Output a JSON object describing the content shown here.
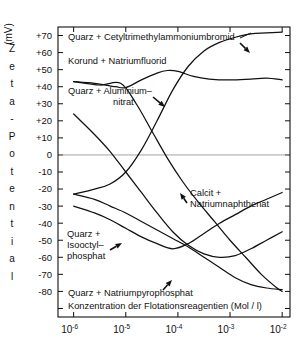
{
  "chart_data": {
    "type": "line",
    "title": "",
    "xlabel": "Konzentration der Flotationsreagentien (Mol / l)",
    "ylabel": "Zeta - Potential",
    "yunit": "(mV)",
    "xlim": [
      -6.3,
      -1.85
    ],
    "ylim": [
      -95,
      75
    ],
    "xscale": "log",
    "grid": false,
    "legend": "inline-annotations",
    "xticks": [
      {
        "label": "10",
        "exp": "-6",
        "value": -6
      },
      {
        "label": "10",
        "exp": "-5",
        "value": -5
      },
      {
        "label": "10",
        "exp": "-4",
        "value": -4
      },
      {
        "label": "10",
        "exp": "-3",
        "value": -3
      },
      {
        "label": "10",
        "exp": "-2",
        "value": -2
      }
    ],
    "yticks": [
      {
        "label": "+70",
        "value": 70
      },
      {
        "label": "+60",
        "value": 60
      },
      {
        "label": "+50",
        "value": 50
      },
      {
        "label": "+40",
        "value": 40
      },
      {
        "label": "+30",
        "value": 30
      },
      {
        "label": "+20",
        "value": 20
      },
      {
        "label": "+10",
        "value": 10
      },
      {
        "label": "0",
        "value": 0
      },
      {
        "label": "-10",
        "value": -10
      },
      {
        "label": "-20",
        "value": -20
      },
      {
        "label": "-30",
        "value": -30
      },
      {
        "label": "-40",
        "value": -40
      },
      {
        "label": "-50",
        "value": -50
      },
      {
        "label": "-60",
        "value": -60
      },
      {
        "label": "-70",
        "value": -70
      },
      {
        "label": "-80",
        "value": -80
      },
      {
        "label": "",
        "value": -90
      }
    ],
    "series": [
      {
        "name": "Quarz + Cetyltrimethylammoniumbromid",
        "points": [
          [
            -6.0,
            24
          ],
          [
            -5.6,
            12
          ],
          [
            -5.3,
            2
          ],
          [
            -5.0,
            -10
          ],
          [
            -4.7,
            -22
          ],
          [
            -4.4,
            -34
          ],
          [
            -4.1,
            -45
          ],
          [
            -3.8,
            -53
          ],
          [
            -3.5,
            -58
          ],
          [
            -3.2,
            -60
          ],
          [
            -2.9,
            -59
          ],
          [
            -2.6,
            -55
          ],
          [
            -2.3,
            -50
          ],
          [
            -2.0,
            -45
          ]
        ]
      },
      {
        "name": "Korund + Natriumfluorid",
        "points": [
          [
            -6.0,
            43
          ],
          [
            -5.6,
            42
          ],
          [
            -5.2,
            40
          ],
          [
            -5.0,
            39.5
          ],
          [
            -4.7,
            44
          ],
          [
            -4.4,
            48
          ],
          [
            -4.2,
            49.5
          ],
          [
            -4.0,
            49
          ],
          [
            -3.7,
            46
          ],
          [
            -3.4,
            44.5
          ],
          [
            -3.0,
            44
          ],
          [
            -2.6,
            44.5
          ],
          [
            -2.3,
            45
          ],
          [
            -2.0,
            44
          ]
        ]
      },
      {
        "name": "Quarz + Aluminiumnitrat",
        "points": [
          [
            -6.0,
            -23
          ],
          [
            -5.6,
            -20
          ],
          [
            -5.3,
            -17
          ],
          [
            -5.0,
            -10
          ],
          [
            -4.7,
            3
          ],
          [
            -4.4,
            20
          ],
          [
            -4.1,
            38
          ],
          [
            -3.8,
            52
          ],
          [
            -3.5,
            61
          ],
          [
            -3.2,
            66
          ],
          [
            -2.9,
            69
          ],
          [
            -2.6,
            71
          ],
          [
            -2.3,
            71.5
          ],
          [
            -2.0,
            72
          ]
        ]
      },
      {
        "name": "Calcit + Natriumnaphthenat",
        "points": [
          [
            -6.0,
            -23
          ],
          [
            -5.6,
            -26
          ],
          [
            -5.3,
            -30
          ],
          [
            -5.0,
            -34
          ],
          [
            -4.7,
            -39
          ],
          [
            -4.4,
            -44
          ],
          [
            -4.1,
            -49
          ],
          [
            -3.8,
            -54
          ],
          [
            -3.5,
            -60
          ],
          [
            -3.2,
            -66
          ],
          [
            -2.9,
            -72
          ],
          [
            -2.6,
            -76
          ],
          [
            -2.3,
            -78
          ],
          [
            -2.0,
            -79
          ]
        ]
      },
      {
        "name": "Quarz + Isooctylphosphat",
        "points": [
          [
            -6.0,
            -30
          ],
          [
            -5.6,
            -34
          ],
          [
            -5.3,
            -38
          ],
          [
            -5.0,
            -43
          ],
          [
            -4.7,
            -48
          ],
          [
            -4.4,
            -52
          ],
          [
            -4.1,
            -55
          ],
          [
            -3.8,
            -52
          ],
          [
            -3.5,
            -46
          ],
          [
            -3.2,
            -40
          ],
          [
            -2.9,
            -35
          ],
          [
            -2.6,
            -30
          ],
          [
            -2.3,
            -26
          ],
          [
            -2.0,
            -22
          ]
        ]
      },
      {
        "name": "Quarz + Natriumpyrophosphat",
        "points": [
          [
            -6.0,
            43
          ],
          [
            -5.5,
            41
          ],
          [
            -5.1,
            42
          ],
          [
            -4.8,
            30
          ],
          [
            -4.5,
            14
          ],
          [
            -4.2,
            -2
          ],
          [
            -3.9,
            -16
          ],
          [
            -3.6,
            -28
          ],
          [
            -3.3,
            -39
          ],
          [
            -3.0,
            -50
          ],
          [
            -2.7,
            -60
          ],
          [
            -2.4,
            -70
          ],
          [
            -2.1,
            -78
          ],
          [
            -2.0,
            -80
          ]
        ]
      }
    ],
    "annotations": [
      {
        "id": "ann-cetyl",
        "text": "Quarz + Cetyltrimethylammoniumbromid"
      },
      {
        "id": "ann-korund",
        "text": "Korund + Natriumfluorid"
      },
      {
        "id": "ann-alu-line1",
        "text": "Quarz + Aluminium–"
      },
      {
        "id": "ann-alu-line2",
        "text": "nitrat"
      },
      {
        "id": "ann-calcit-line1",
        "text": "Calcit +"
      },
      {
        "id": "ann-calcit-line2",
        "text": "Natriumnaphthenat"
      },
      {
        "id": "ann-iso-line1",
        "text": "Quarz +"
      },
      {
        "id": "ann-iso-line2",
        "text": "Isooctyl–"
      },
      {
        "id": "ann-iso-line3",
        "text": "phosphat"
      },
      {
        "id": "ann-pyro",
        "text": "Quarz + Natriumpyrophosphat"
      },
      {
        "id": "ann-xaxis",
        "text": "Konzentration der Flotationsreagentien (Mol / l)"
      }
    ],
    "yaxis_letters": [
      "Z",
      "e",
      "t",
      "a",
      "-",
      "P",
      "o",
      "t",
      "e",
      "n",
      "t",
      "i",
      "a",
      "l"
    ],
    "colors": {
      "curve": "#111111",
      "axis": "#111111",
      "zero_line": "#9a9a9a",
      "background": "#ffffff",
      "text": "#111111"
    }
  }
}
